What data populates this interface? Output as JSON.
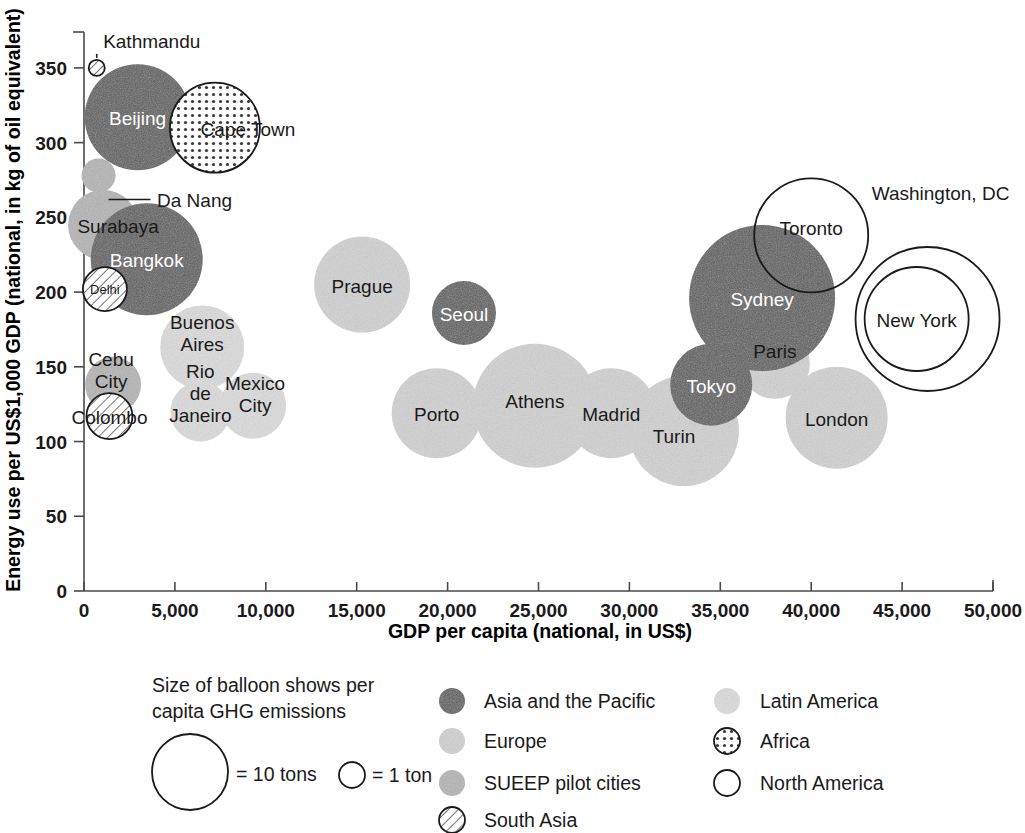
{
  "chart_data": {
    "type": "scatter",
    "title": "",
    "xlabel": "GDP per capita (national, in US$)",
    "ylabel": "Energy use per US$1,000 GDP (national, in kg of oil equivalent)",
    "xlim": [
      0,
      50000
    ],
    "ylim": [
      0,
      370
    ],
    "grid": false,
    "xticks": [
      0,
      5000,
      10000,
      15000,
      20000,
      25000,
      30000,
      35000,
      40000,
      45000,
      50000
    ],
    "xtick_labels": [
      "0",
      "5,000",
      "10,000",
      "15,000",
      "20,000",
      "25,000",
      "30,000",
      "35,000",
      "40,000",
      "45,000",
      "50,000"
    ],
    "yticks": [
      0,
      50,
      100,
      150,
      200,
      250,
      300,
      350
    ],
    "ytick_labels": [
      "0",
      "50",
      "100",
      "150",
      "200",
      "250",
      "300",
      "350"
    ],
    "size_encoding": "Bubble area shows per capita GHG emissions (tons)",
    "points": [
      {
        "name": "Kathmandu",
        "x": 700,
        "y": 350,
        "r_px": 8,
        "tons": 0.6,
        "group": "south_asia",
        "label_dx": 55,
        "label_dy": -20,
        "label_color": "dark",
        "label_lines": [
          "Kathmandu"
        ]
      },
      {
        "name": "Beijing",
        "x": 2950,
        "y": 317,
        "r_px": 53,
        "tons": 11.0,
        "group": "asia_pacific",
        "label_dx": 0,
        "label_dy": 8,
        "label_color": "light",
        "label_lines": [
          "Beijing"
        ]
      },
      {
        "name": "Cape Town",
        "x": 7200,
        "y": 310,
        "r_px": 45,
        "tons": 8.0,
        "group": "africa",
        "label_dx": 33,
        "label_dy": 8,
        "label_color": "dark",
        "label_lines": [
          "Cape Town"
        ]
      },
      {
        "name": "Da Nang",
        "x": 800,
        "y": 278,
        "r_px": 17,
        "tons": 1.3,
        "group": "sueep",
        "label_dx": 96,
        "label_dy": 31,
        "label_color": "dark",
        "label_lines": [
          "Da Nang"
        ]
      },
      {
        "name": "Surabaya",
        "x": 1050,
        "y": 245,
        "r_px": 35,
        "tons": 4.5,
        "group": "sueep",
        "label_dx": 15,
        "label_dy": 8,
        "label_color": "dark",
        "label_lines": [
          "Surabaya"
        ]
      },
      {
        "name": "Bangkok",
        "x": 3450,
        "y": 222,
        "r_px": 56,
        "tons": 12.0,
        "group": "asia_pacific",
        "label_dx": 0,
        "label_dy": 8,
        "label_color": "light",
        "label_lines": [
          "Bangkok"
        ]
      },
      {
        "name": "Delhi",
        "x": 1150,
        "y": 202,
        "r_px": 22,
        "tons": 1.9,
        "group": "south_asia",
        "label_dx": 0,
        "label_dy": 5,
        "label_color": "dark",
        "label_lines": [
          "Delhi"
        ]
      },
      {
        "name": "Cebu City",
        "x": 1600,
        "y": 138,
        "r_px": 28,
        "tons": 2.9,
        "group": "sueep",
        "label_dx": -2,
        "label_dy": -8,
        "label_color": "dark",
        "label_lines": [
          "Cebu",
          "City"
        ]
      },
      {
        "name": "Colombo",
        "x": 1400,
        "y": 117,
        "r_px": 23,
        "tons": 2.1,
        "group": "south_asia",
        "label_dx": 0,
        "label_dy": 8,
        "label_color": "dark",
        "label_lines": [
          "Colombo"
        ]
      },
      {
        "name": "Buenos Aires",
        "x": 6500,
        "y": 163,
        "r_px": 42,
        "tons": 7.0,
        "group": "latin",
        "label_dx": 0,
        "label_dy": -7,
        "label_color": "dark",
        "label_lines": [
          "Buenos",
          "Aires"
        ]
      },
      {
        "name": "Rio de Janeiro",
        "x": 6400,
        "y": 120,
        "r_px": 30,
        "tons": 3.3,
        "group": "latin",
        "label_dx": 0,
        "label_dy": -12,
        "label_color": "dark",
        "label_lines": [
          "Rio",
          "de",
          "Janeiro"
        ]
      },
      {
        "name": "Mexico City",
        "x": 9300,
        "y": 124,
        "r_px": 33,
        "tons": 4.0,
        "group": "latin",
        "label_dx": 2,
        "label_dy": -5,
        "label_color": "dark",
        "label_lines": [
          "Mexico",
          "City"
        ]
      },
      {
        "name": "Prague",
        "x": 15300,
        "y": 205,
        "r_px": 48,
        "tons": 9.0,
        "group": "europe",
        "label_dx": 0,
        "label_dy": 8,
        "label_color": "dark",
        "label_lines": [
          "Prague"
        ]
      },
      {
        "name": "Seoul",
        "x": 20900,
        "y": 186,
        "r_px": 32,
        "tons": 3.9,
        "group": "asia_pacific",
        "label_dx": 0,
        "label_dy": 8,
        "label_color": "light",
        "label_lines": [
          "Seoul"
        ]
      },
      {
        "name": "Porto",
        "x": 19400,
        "y": 119,
        "r_px": 45,
        "tons": 8.0,
        "group": "europe",
        "label_dx": 0,
        "label_dy": 8,
        "label_color": "dark",
        "label_lines": [
          "Porto"
        ]
      },
      {
        "name": "Athens",
        "x": 24800,
        "y": 124,
        "r_px": 62,
        "tons": 14.0,
        "group": "europe",
        "label_dx": 0,
        "label_dy": 2,
        "label_color": "dark",
        "label_lines": [
          "Athens"
        ]
      },
      {
        "name": "Madrid",
        "x": 29000,
        "y": 119,
        "r_px": 45,
        "tons": 8.0,
        "group": "europe",
        "label_dx": 0,
        "label_dy": 8,
        "label_color": "dark",
        "label_lines": [
          "Madrid"
        ]
      },
      {
        "name": "Turin",
        "x": 33000,
        "y": 107,
        "r_px": 55,
        "tons": 11.5,
        "group": "europe",
        "label_dx": -10,
        "label_dy": 12,
        "label_color": "dark",
        "label_lines": [
          "Turin"
        ]
      },
      {
        "name": "Tokyo",
        "x": 34500,
        "y": 138,
        "r_px": 41,
        "tons": 6.7,
        "group": "asia_pacific",
        "label_dx": 0,
        "label_dy": 8,
        "label_color": "light",
        "label_lines": [
          "Tokyo"
        ]
      },
      {
        "name": "Paris",
        "x": 38000,
        "y": 152,
        "r_px": 35,
        "tons": 4.9,
        "group": "europe",
        "label_dx": 0,
        "label_dy": -6,
        "label_color": "dark",
        "label_lines": [
          "Paris"
        ]
      },
      {
        "name": "London",
        "x": 41400,
        "y": 116,
        "r_px": 51,
        "tons": 10.2,
        "group": "europe",
        "label_dx": 0,
        "label_dy": 8,
        "label_color": "dark",
        "label_lines": [
          "London"
        ]
      },
      {
        "name": "Sydney",
        "x": 37300,
        "y": 196,
        "r_px": 73,
        "tons": 19.0,
        "group": "asia_pacific",
        "label_dx": 0,
        "label_dy": 8,
        "label_color": "light",
        "label_lines": [
          "Sydney"
        ]
      },
      {
        "name": "Toronto",
        "x": 40000,
        "y": 238,
        "r_px": 57,
        "tons": 12.2,
        "group": "north_america",
        "label_dx": 0,
        "label_dy": 0,
        "label_color": "dark",
        "label_lines": [
          "Toronto"
        ]
      },
      {
        "name": "New York",
        "x": 45800,
        "y": 182,
        "r_px": 52,
        "tons": 10.4,
        "group": "north_america",
        "label_dx": 0,
        "label_dy": 8,
        "label_color": "dark",
        "label_lines": [
          "New York"
        ]
      },
      {
        "name": "Washington, DC",
        "x": 46400,
        "y": 182,
        "r_px": 72,
        "tons": 18.5,
        "group": "north_america",
        "label_dx": 13,
        "label_dy": -119,
        "label_color": "dark",
        "label_lines": [
          "Washington, DC"
        ]
      }
    ]
  },
  "legend": {
    "size_note_lines": [
      "Size of balloon shows per",
      "capita GHG emissions"
    ],
    "size_big_label": "= 10 tons",
    "size_small_label": "= 1 ton",
    "entries": [
      {
        "label": "Asia and the Pacific",
        "style": "asia_pacific"
      },
      {
        "label": "Europe",
        "style": "europe"
      },
      {
        "label": "SUEEP pilot cities",
        "style": "sueep"
      },
      {
        "label": "South Asia",
        "style": "south_asia"
      },
      {
        "label": "Latin America",
        "style": "latin"
      },
      {
        "label": "Africa",
        "style": "africa"
      },
      {
        "label": "North America",
        "style": "north_america"
      }
    ]
  },
  "colors": {
    "asia_pacific": "#5c5c5c",
    "europe": "#d2d2d2",
    "sueep": "#b4b4b4",
    "south_asia": "#ffffff",
    "latin": "#dcdcdc",
    "africa": "#ffffff",
    "north_america": "#ffffff",
    "axis": "#4a4a4a",
    "text": "#1a1a1a"
  }
}
